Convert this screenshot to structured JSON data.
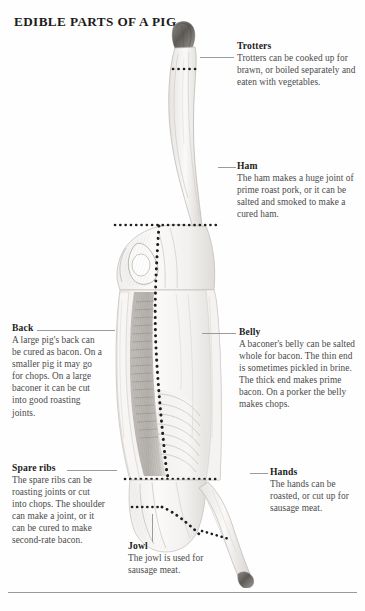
{
  "page": {
    "title": "EDIBLE PARTS OF A PIG",
    "figure_name": "pig-carcass-illustration",
    "rule_color": "#9a9a9a",
    "leader_color": "#9b9b9b",
    "heading_color": "#1d1d1d",
    "body_color": "#4a4a4a",
    "background": "#fefefe"
  },
  "annotations": [
    {
      "id": "trotters",
      "heading": "Trotters",
      "body": "Trotters can be cooked up for brawn, or boiled separately and eaten with vegetables.",
      "side": "right"
    },
    {
      "id": "ham",
      "heading": "Ham",
      "body": "The ham makes a huge joint of prime roast pork, or it can be salted and smoked to make a cured ham.",
      "side": "right"
    },
    {
      "id": "back",
      "heading": "Back",
      "body": "A large pig's back can be cured as bacon. On a smaller pig it may go for chops. On a large baconer it can be cut into good roasting joints.",
      "side": "left"
    },
    {
      "id": "belly",
      "heading": "Belly",
      "body": "A baconer's belly can be salted whole for bacon. The thin end is sometimes pickled in brine. The thick end makes prime bacon. On a porker the belly makes chops.",
      "side": "right"
    },
    {
      "id": "spare-ribs",
      "heading": "Spare ribs",
      "body": "The spare ribs can be roasting joints or cut into chops. The shoulder can make a joint, or it can be cured to make second-rate bacon.",
      "side": "left"
    },
    {
      "id": "hands",
      "heading": "Hands",
      "body": "The hands can be roasted, or cut up for sausage meat.",
      "side": "right"
    },
    {
      "id": "jowl",
      "heading": "Jowl",
      "body": "The jowl is used for sausage meat.",
      "side": "left"
    }
  ]
}
